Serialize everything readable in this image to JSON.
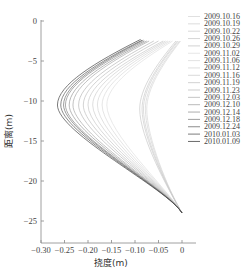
{
  "chart_data": {
    "type": "line",
    "title": "",
    "xlabel": "挠度(m)",
    "ylabel": "距离(m)",
    "xlim": [
      -0.3,
      0.02
    ],
    "ylim": [
      -27.5,
      0
    ],
    "xticks": [
      "-0.30",
      "-0.25",
      "-0.20",
      "-0.15",
      "-0.10",
      "-0.05",
      "0"
    ],
    "yticks": [
      "0",
      "-5",
      "-10",
      "-15",
      "-20",
      "-25"
    ],
    "grid": false,
    "legend_position": "right",
    "series": [
      {
        "name": "2009.10.16",
        "color": "#d8d8d8",
        "top": [
          -0.003,
          -2.5
        ],
        "min": [
          -0.075,
          -11.0
        ],
        "bottom": [
          0.0,
          -24.0
        ]
      },
      {
        "name": "2009.10.19",
        "color": "#d4d4d4",
        "top": [
          -0.005,
          -2.5
        ],
        "min": [
          -0.078,
          -11.0
        ],
        "bottom": [
          0.0,
          -24.0
        ]
      },
      {
        "name": "2009.10.22",
        "color": "#d0d0d0",
        "top": [
          -0.008,
          -2.5
        ],
        "min": [
          -0.082,
          -11.0
        ],
        "bottom": [
          0.0,
          -24.0
        ]
      },
      {
        "name": "2009.10.26",
        "color": "#cccccc",
        "top": [
          -0.01,
          -2.5
        ],
        "min": [
          -0.085,
          -11.0
        ],
        "bottom": [
          0.0,
          -24.0
        ]
      },
      {
        "name": "2009.10.29",
        "color": "#c8c8c8",
        "top": [
          -0.013,
          -2.5
        ],
        "min": [
          -0.09,
          -11.0
        ],
        "bottom": [
          0.0,
          -24.0
        ]
      },
      {
        "name": "2009.11.02",
        "color": "#e0e0e0",
        "top": [
          -0.02,
          -2.5
        ],
        "min": [
          -0.16,
          -10.5
        ],
        "bottom": [
          0.0,
          -24.0
        ]
      },
      {
        "name": "2009.11.06",
        "color": "#dadada",
        "top": [
          -0.025,
          -2.5
        ],
        "min": [
          -0.17,
          -10.5
        ],
        "bottom": [
          0.0,
          -24.0
        ]
      },
      {
        "name": "2009.11.12",
        "color": "#d5d5d5",
        "top": [
          -0.03,
          -2.5
        ],
        "min": [
          -0.18,
          -10.5
        ],
        "bottom": [
          0.0,
          -24.0
        ]
      },
      {
        "name": "2009.11.16",
        "color": "#d0d0d0",
        "top": [
          -0.035,
          -2.5
        ],
        "min": [
          -0.19,
          -10.5
        ],
        "bottom": [
          0.0,
          -24.0
        ]
      },
      {
        "name": "2009.11.19",
        "color": "#c8c8c8",
        "top": [
          -0.04,
          -2.5
        ],
        "min": [
          -0.2,
          -10.5
        ],
        "bottom": [
          0.0,
          -24.0
        ]
      },
      {
        "name": "2009.11.23",
        "color": "#c0c0c0",
        "top": [
          -0.05,
          -2.5
        ],
        "min": [
          -0.21,
          -10.5
        ],
        "bottom": [
          0.0,
          -24.0
        ]
      },
      {
        "name": "2009.12.03",
        "color": "#b8b8b8",
        "top": [
          -0.06,
          -2.5
        ],
        "min": [
          -0.22,
          -10.5
        ],
        "bottom": [
          0.0,
          -24.0
        ]
      },
      {
        "name": "2009.12.10",
        "color": "#a8a8a8",
        "top": [
          -0.07,
          -2.5
        ],
        "min": [
          -0.232,
          -10.5
        ],
        "bottom": [
          0.0,
          -24.0
        ]
      },
      {
        "name": "2009.12.14",
        "color": "#989898",
        "top": [
          -0.075,
          -2.5
        ],
        "min": [
          -0.24,
          -10.5
        ],
        "bottom": [
          0.0,
          -24.0
        ]
      },
      {
        "name": "2009.12.18",
        "color": "#888888",
        "top": [
          -0.08,
          -2.5
        ],
        "min": [
          -0.248,
          -10.5
        ],
        "bottom": [
          0.0,
          -24.0
        ]
      },
      {
        "name": "2009.12.24",
        "color": "#707070",
        "top": [
          -0.082,
          -2.4
        ],
        "min": [
          -0.252,
          -10.5
        ],
        "bottom": [
          0.0,
          -24.0
        ]
      },
      {
        "name": "2010.01.03",
        "color": "#5a5a5a",
        "top": [
          -0.085,
          -2.4
        ],
        "min": [
          -0.258,
          -10.5
        ],
        "bottom": [
          0.0,
          -24.0
        ]
      },
      {
        "name": "2010.01.09",
        "color": "#444444",
        "top": [
          -0.088,
          -2.3
        ],
        "min": [
          -0.265,
          -10.5
        ],
        "bottom": [
          0.0,
          -24.0
        ]
      }
    ]
  }
}
